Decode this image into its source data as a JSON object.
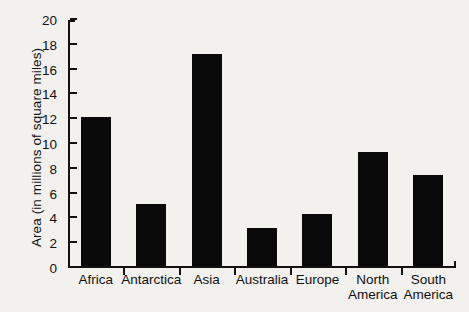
{
  "chart_data": {
    "type": "bar",
    "title": "",
    "xlabel": "",
    "ylabel": "Area (in millions of square miles)",
    "categories": [
      "Africa",
      "Antarctica",
      "Asia",
      "Australia",
      "Europe",
      "North America",
      "South America"
    ],
    "category_lines": [
      [
        "Africa"
      ],
      [
        "Antarctica"
      ],
      [
        "Asia"
      ],
      [
        "Australia"
      ],
      [
        "Europe"
      ],
      [
        "North",
        "America"
      ],
      [
        "South",
        "America"
      ]
    ],
    "values": [
      12.0,
      5.0,
      17.1,
      3.1,
      4.2,
      9.2,
      7.3
    ],
    "ylim": [
      0,
      20
    ],
    "ytick_values": [
      0,
      2,
      4,
      6,
      8,
      10,
      12,
      14,
      16,
      18,
      20
    ],
    "ytick_labels": [
      "0",
      "2",
      "4",
      "6",
      "8",
      "10",
      "12",
      "14",
      "16",
      "18",
      "20"
    ],
    "grid": false,
    "legend": null,
    "bar_color": "#090909",
    "axis_color": "#121212",
    "background_color": "#f2f1ee"
  }
}
